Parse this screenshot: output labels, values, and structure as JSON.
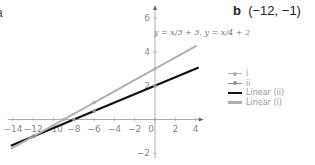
{
  "panel": {
    "cut_label": "a",
    "label_letter": "b",
    "label_text": "(−12, −1)"
  },
  "annotation": "y = x/3 + 3, y = x/4 + 2",
  "legend": [
    {
      "label": "i",
      "style": "marker",
      "color": "#b0b0b0"
    },
    {
      "label": "ii",
      "style": "marker",
      "color": "#909090"
    },
    {
      "label": "Linear (ii)",
      "style": "line",
      "color": "#111111"
    },
    {
      "label": "Linear (i)",
      "style": "line",
      "color": "#b0b0b0"
    }
  ],
  "chart_data": {
    "type": "line",
    "title": "",
    "annotation": "y = x/3 + 3, y = x/4 + 2",
    "solution_label": "b (−12, −1)",
    "xlabel": "",
    "ylabel": "",
    "xlim": [
      -14.5,
      4.5
    ],
    "ylim": [
      -2.3,
      6.6
    ],
    "x_ticks": [
      -14,
      -12,
      -10,
      -8,
      -6,
      -4,
      -2,
      0,
      2,
      4
    ],
    "y_ticks": [
      -2,
      2,
      4,
      6
    ],
    "grid": false,
    "legend_position": "right",
    "series": [
      {
        "name": "i",
        "type": "scatter",
        "color": "#b0b0b0",
        "points": [
          [
            -12,
            -1
          ],
          [
            -9,
            0
          ],
          [
            -6,
            1
          ],
          [
            0,
            3
          ]
        ]
      },
      {
        "name": "ii",
        "type": "scatter",
        "color": "#909090",
        "points": [
          [
            -12,
            -1
          ],
          [
            -8,
            0
          ],
          [
            -6,
            0.5
          ],
          [
            0,
            2
          ]
        ]
      },
      {
        "name": "Linear (ii)",
        "type": "line",
        "color": "#111111",
        "equation": "y = x/4 + 2",
        "x_range": [
          -14.2,
          4.3
        ]
      },
      {
        "name": "Linear (i)",
        "type": "line",
        "color": "#b0b0b0",
        "equation": "y = x/3 + 3",
        "x_range": [
          -14.2,
          4.1
        ]
      }
    ],
    "intersection": [
      -12,
      -1
    ]
  }
}
